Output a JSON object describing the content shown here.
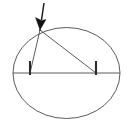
{
  "figure": {
    "background_color": "#ffffff",
    "stroke_color": "#4a4a4a",
    "accent_color": "#121212",
    "canvas": {
      "width": 129,
      "height": 126
    },
    "elements": {
      "ellipse_label": "ellipse outline",
      "chord_label": "horizontal diameter chord",
      "left_ray_label": "left ray from apex",
      "right_ray_label": "right ray from apex",
      "left_tick_label": "left perpendicular tick mark",
      "right_tick_label": "right perpendicular tick mark",
      "arrow_label": "pointer arrow to apex",
      "apex_label": "apex vertex point"
    }
  },
  "chart_data": {
    "type": "scatter",
    "xlabel": "",
    "ylabel": "",
    "xlim": [
      0,
      129
    ],
    "ylim": [
      0,
      126
    ],
    "grid": false,
    "legend": "none",
    "ellipse": {
      "center_x": 66.5,
      "center_y": 73,
      "radius_x": 53.5,
      "radius_y": 45.5
    },
    "chord": {
      "x1": 13,
      "y1": 73,
      "x2": 120,
      "y2": 73
    },
    "apex": {
      "x": 40,
      "y": 30
    },
    "rays": [
      {
        "name": "left-ray",
        "x1": 40,
        "y1": 30,
        "x2": 30,
        "y2": 73
      },
      {
        "name": "right-ray",
        "x1": 40,
        "y1": 30,
        "x2": 96,
        "y2": 73
      }
    ],
    "ticks": [
      {
        "name": "left-tick",
        "x": 30,
        "y_top": 61,
        "y_bottom": 75
      },
      {
        "name": "right-tick",
        "x": 96,
        "y_top": 61,
        "y_bottom": 75
      }
    ],
    "arrow": {
      "shaft_x1": 44,
      "shaft_y1": 3,
      "shaft_x2": 41.5,
      "shaft_y2": 20,
      "tip_x": 40,
      "tip_y": 30,
      "head_left_x": 35.5,
      "head_left_y": 17.5,
      "head_right_x": 46,
      "head_right_y": 19.5
    }
  }
}
